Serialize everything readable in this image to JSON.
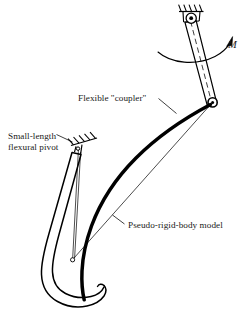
{
  "figure": {
    "background_color": "#ffffff",
    "ink_color": "#000000",
    "labels": {
      "flexible_coupler": "Flexible \"coupler\"",
      "flexural_pivot_line1": "Small-length",
      "flexural_pivot_line2": "flexural pivot",
      "pseudo_rigid_body_model": "Pseudo-rigid-body model",
      "moment": "M"
    },
    "icons": {
      "ground_pivot": "ground-pivot-icon",
      "flexural_pivot_ground": "ground-hatch-icon",
      "moment_arrow": "curved-arrow-icon",
      "revolute_joint": "revolute-joint-icon",
      "characteristic_pivot": "characteristic-pivot-icon"
    },
    "geometry": {
      "ground_pivot_center": [
        191,
        19
      ],
      "coupler_joint": [
        213,
        102
      ],
      "flexural_pivot_center": [
        78,
        149
      ],
      "characteristic_pivot_center": [
        72,
        260
      ],
      "hook_tip": [
        105,
        300
      ]
    }
  }
}
